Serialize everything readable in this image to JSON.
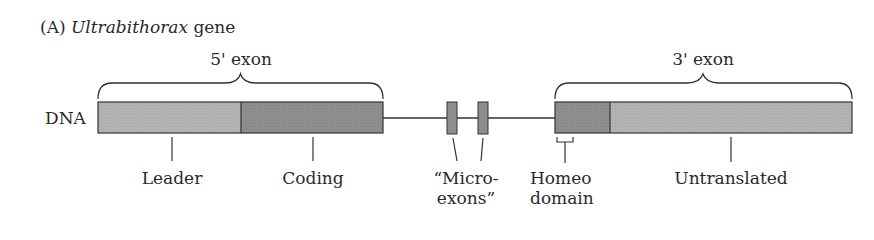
{
  "title": {
    "panel": "(A)",
    "gene_name": "Ultrabithorax",
    "suffix": "gene"
  },
  "row_label": "DNA",
  "brackets": {
    "five_prime": "5' exon",
    "three_prime": "3' exon"
  },
  "segments": {
    "leader": "Leader",
    "coding": "Coding",
    "microexons_line1": "“Micro-",
    "microexons_line2": "exons”",
    "homeo_line1": "Homeo",
    "homeo_line2": "domain",
    "untranslated": "Untranslated"
  },
  "colors": {
    "light_fill": "#b3b3b3",
    "dark_fill": "#8e8e8e",
    "stroke": "#333333"
  }
}
